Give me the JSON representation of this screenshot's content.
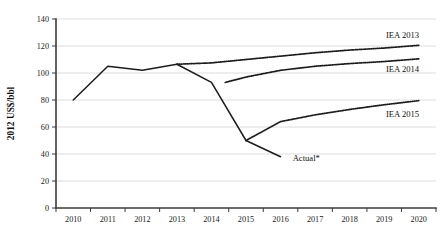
{
  "chart_data": {
    "type": "line",
    "title": "",
    "xlabel": "",
    "ylabel": "2012 US$/bbl",
    "xlim": [
      2009.5,
      2020.5
    ],
    "ylim": [
      0,
      140
    ],
    "yticks": [
      0,
      20,
      40,
      60,
      80,
      100,
      120,
      140
    ],
    "ytick_labels": [
      "0",
      "20",
      "40",
      "60",
      "80",
      "100",
      "120",
      "140"
    ],
    "xticks": [
      2010,
      2011,
      2012,
      2013,
      2014,
      2015,
      2016,
      2017,
      2018,
      2019,
      2020
    ],
    "xtick_labels": [
      "2010",
      "2011",
      "2012",
      "2013",
      "2014",
      "2015",
      "2016",
      "2017",
      "2018",
      "2019",
      "2020"
    ],
    "grid": "horizontal",
    "legend_position": "inline-right-labels",
    "series": [
      {
        "name": "Actual*",
        "style": "solid",
        "label": "Actual*",
        "label_x": 2016.35,
        "label_y": 37,
        "x": [
          2010,
          2011,
          2012,
          2013,
          2014,
          2015,
          2016
        ],
        "values": [
          80,
          105,
          102,
          106.5,
          93,
          50,
          38
        ]
      },
      {
        "name": "IEA 2013",
        "style": "dotted",
        "label": "IEA 2013",
        "label_x": 2019.05,
        "label_y": 128,
        "x": [
          2013,
          2014,
          2015,
          2016,
          2017,
          2018,
          2019,
          2020
        ],
        "values": [
          106.5,
          107.5,
          110,
          112.5,
          115,
          117,
          118.5,
          120.5
        ]
      },
      {
        "name": "IEA 2014",
        "style": "dotted",
        "label": "IEA 2014",
        "label_x": 2019.05,
        "label_y": 103,
        "x": [
          2014.4,
          2015,
          2016,
          2017,
          2018,
          2019,
          2020
        ],
        "values": [
          93,
          97,
          102,
          105,
          107,
          108.5,
          110.5
        ]
      },
      {
        "name": "IEA 2015",
        "style": "dotted",
        "label": "IEA 2015",
        "label_x": 2019.05,
        "label_y": 70,
        "x": [
          2015,
          2016,
          2017,
          2018,
          2019,
          2020
        ],
        "values": [
          50,
          64,
          69,
          73,
          76.5,
          79.5
        ]
      }
    ],
    "colors": {
      "line": "#1c1c1c",
      "grid": "#d4d4d4",
      "axis": "#3b3b3b",
      "text": "#111111",
      "background": "#ffffff"
    }
  }
}
